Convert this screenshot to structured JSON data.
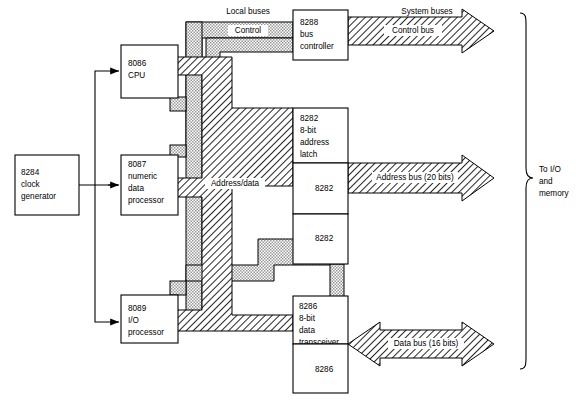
{
  "diagram": {
    "blocks": [
      {
        "id": "clk",
        "lines": [
          "8284",
          "clock",
          "generator"
        ]
      },
      {
        "id": "cpu",
        "lines": [
          "8086",
          "CPU"
        ]
      },
      {
        "id": "npx",
        "lines": [
          "8087",
          "numeric",
          "data",
          "processor"
        ]
      },
      {
        "id": "iop",
        "lines": [
          "8089",
          "I/O",
          "processor"
        ]
      },
      {
        "id": "ctrl",
        "lines": [
          "8288",
          "bus",
          "controller"
        ]
      },
      {
        "id": "latch1",
        "lines": [
          "8282",
          "8-bit",
          "address",
          "latch"
        ]
      },
      {
        "id": "latch2",
        "lines": [
          "8282"
        ]
      },
      {
        "id": "latch3",
        "lines": [
          "8282"
        ]
      },
      {
        "id": "xcvr1",
        "lines": [
          "8286",
          "8-bit",
          "data",
          "transceiver"
        ]
      },
      {
        "id": "xcvr2",
        "lines": [
          "8286"
        ]
      }
    ],
    "bus_labels": {
      "local_buses": "Local buses",
      "system_buses": "System buses",
      "control": "Control",
      "address_data": "Address/data",
      "control_bus": "Control bus",
      "address_bus": "Address bus (20 bits)",
      "data_bus": "Data bus (16 bits)"
    },
    "destination": [
      "To I/O",
      "and",
      "memory"
    ],
    "colors": {
      "ink": "#000000",
      "paper": "#ffffff",
      "stipple_fill": "#d9d9d9",
      "hatch_fill": "#ffffff"
    }
  }
}
